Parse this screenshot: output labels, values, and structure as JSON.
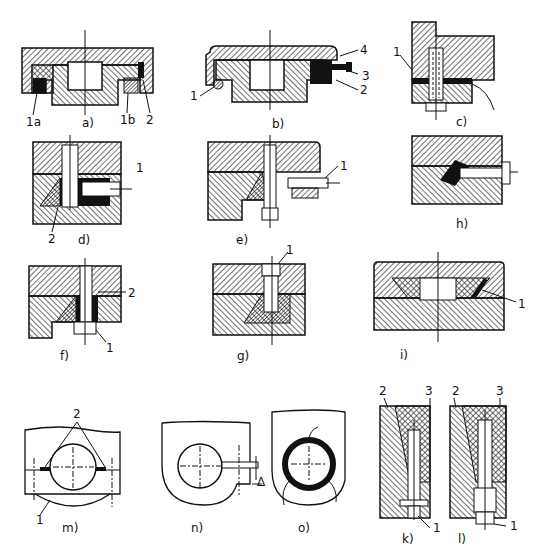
{
  "figure": {
    "panels": [
      {
        "id": "a",
        "caption": "a)",
        "callouts": [
          "1a",
          "1b",
          "2"
        ]
      },
      {
        "id": "b",
        "caption": "b)",
        "callouts": [
          "1",
          "2",
          "3",
          "4"
        ]
      },
      {
        "id": "c",
        "caption": "c)",
        "callouts": [
          "1"
        ]
      },
      {
        "id": "d",
        "caption": "d)",
        "callouts": [
          "1",
          "2"
        ]
      },
      {
        "id": "e",
        "caption": "e)",
        "callouts": [
          "1"
        ]
      },
      {
        "id": "h",
        "caption": "h)",
        "callouts": []
      },
      {
        "id": "f",
        "caption": "f)",
        "callouts": [
          "1",
          "2"
        ]
      },
      {
        "id": "g",
        "caption": "g)",
        "callouts": [
          "1"
        ]
      },
      {
        "id": "i",
        "caption": "i)",
        "callouts": [
          "1"
        ]
      },
      {
        "id": "m",
        "caption": "m)",
        "callouts": [
          "1",
          "2"
        ]
      },
      {
        "id": "n",
        "caption": "n)",
        "callouts": [
          "Δ"
        ]
      },
      {
        "id": "o",
        "caption": "o)",
        "callouts": []
      },
      {
        "id": "k",
        "caption": "k)",
        "callouts": [
          "1",
          "2",
          "3"
        ]
      },
      {
        "id": "l",
        "caption": "l)",
        "callouts": [
          "1",
          "2",
          "3"
        ]
      }
    ]
  }
}
